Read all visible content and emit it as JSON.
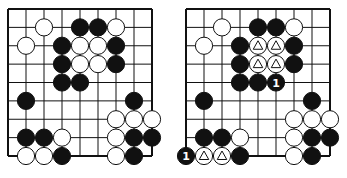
{
  "diagrams": [
    {
      "id": "left",
      "origin_x": 8,
      "origin_y": 9,
      "cols": 9,
      "rows": 9,
      "spacing": 18,
      "stones": [
        {
          "c": 2,
          "r": 1,
          "color": "white"
        },
        {
          "c": 4,
          "r": 1,
          "color": "black"
        },
        {
          "c": 5,
          "r": 1,
          "color": "black"
        },
        {
          "c": 6,
          "r": 1,
          "color": "white"
        },
        {
          "c": 1,
          "r": 2,
          "color": "white"
        },
        {
          "c": 3,
          "r": 2,
          "color": "black"
        },
        {
          "c": 4,
          "r": 2,
          "color": "white"
        },
        {
          "c": 5,
          "r": 2,
          "color": "white"
        },
        {
          "c": 6,
          "r": 2,
          "color": "black"
        },
        {
          "c": 3,
          "r": 3,
          "color": "black"
        },
        {
          "c": 4,
          "r": 3,
          "color": "white"
        },
        {
          "c": 5,
          "r": 3,
          "color": "white"
        },
        {
          "c": 6,
          "r": 3,
          "color": "black"
        },
        {
          "c": 3,
          "r": 4,
          "color": "black"
        },
        {
          "c": 4,
          "r": 4,
          "color": "black"
        },
        {
          "c": 1,
          "r": 5,
          "color": "black"
        },
        {
          "c": 7,
          "r": 5,
          "color": "black"
        },
        {
          "c": 6,
          "r": 6,
          "color": "white"
        },
        {
          "c": 7,
          "r": 6,
          "color": "white"
        },
        {
          "c": 8,
          "r": 6,
          "color": "white"
        },
        {
          "c": 1,
          "r": 7,
          "color": "black"
        },
        {
          "c": 2,
          "r": 7,
          "color": "black"
        },
        {
          "c": 3,
          "r": 7,
          "color": "white"
        },
        {
          "c": 6,
          "r": 7,
          "color": "white"
        },
        {
          "c": 7,
          "r": 7,
          "color": "black"
        },
        {
          "c": 8,
          "r": 7,
          "color": "black"
        },
        {
          "c": 1,
          "r": 8,
          "color": "white"
        },
        {
          "c": 2,
          "r": 8,
          "color": "white"
        },
        {
          "c": 3,
          "r": 8,
          "color": "black"
        },
        {
          "c": 6,
          "r": 8,
          "color": "white"
        },
        {
          "c": 7,
          "r": 8,
          "color": "black"
        }
      ]
    },
    {
      "id": "right",
      "origin_x": 186,
      "origin_y": 9,
      "cols": 9,
      "rows": 9,
      "spacing": 18,
      "stones": [
        {
          "c": 2,
          "r": 1,
          "color": "white"
        },
        {
          "c": 4,
          "r": 1,
          "color": "black"
        },
        {
          "c": 5,
          "r": 1,
          "color": "black"
        },
        {
          "c": 6,
          "r": 1,
          "color": "white"
        },
        {
          "c": 1,
          "r": 2,
          "color": "white"
        },
        {
          "c": 3,
          "r": 2,
          "color": "black"
        },
        {
          "c": 4,
          "r": 2,
          "color": "white",
          "mark": "triangle"
        },
        {
          "c": 5,
          "r": 2,
          "color": "white",
          "mark": "triangle"
        },
        {
          "c": 6,
          "r": 2,
          "color": "black"
        },
        {
          "c": 3,
          "r": 3,
          "color": "black"
        },
        {
          "c": 4,
          "r": 3,
          "color": "white",
          "mark": "triangle"
        },
        {
          "c": 5,
          "r": 3,
          "color": "white",
          "mark": "triangle"
        },
        {
          "c": 6,
          "r": 3,
          "color": "black"
        },
        {
          "c": 3,
          "r": 4,
          "color": "black"
        },
        {
          "c": 4,
          "r": 4,
          "color": "black"
        },
        {
          "c": 5,
          "r": 4,
          "color": "black",
          "label": "1"
        },
        {
          "c": 1,
          "r": 5,
          "color": "black"
        },
        {
          "c": 7,
          "r": 5,
          "color": "black"
        },
        {
          "c": 6,
          "r": 6,
          "color": "white"
        },
        {
          "c": 7,
          "r": 6,
          "color": "white"
        },
        {
          "c": 8,
          "r": 6,
          "color": "white"
        },
        {
          "c": 1,
          "r": 7,
          "color": "black"
        },
        {
          "c": 2,
          "r": 7,
          "color": "black"
        },
        {
          "c": 3,
          "r": 7,
          "color": "white"
        },
        {
          "c": 6,
          "r": 7,
          "color": "white"
        },
        {
          "c": 7,
          "r": 7,
          "color": "black"
        },
        {
          "c": 8,
          "r": 7,
          "color": "black"
        },
        {
          "c": 0,
          "r": 8,
          "color": "black",
          "label": "1"
        },
        {
          "c": 1,
          "r": 8,
          "color": "white",
          "mark": "triangle"
        },
        {
          "c": 2,
          "r": 8,
          "color": "white",
          "mark": "triangle"
        },
        {
          "c": 3,
          "r": 8,
          "color": "black"
        },
        {
          "c": 6,
          "r": 8,
          "color": "white"
        },
        {
          "c": 7,
          "r": 8,
          "color": "black"
        }
      ]
    }
  ],
  "colors": {
    "line": "#111111",
    "black_stone": "#111111",
    "white_stone": "#ffffff",
    "background": "#ffffff"
  }
}
